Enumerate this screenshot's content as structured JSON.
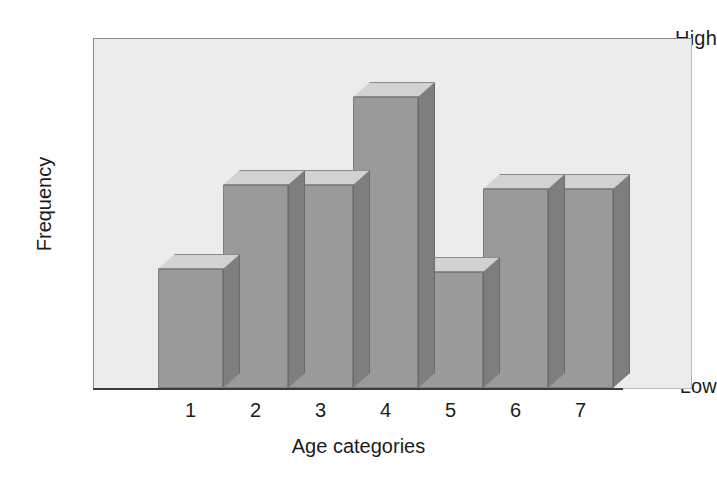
{
  "chart_data": {
    "type": "bar",
    "title": "",
    "subtitle": "",
    "xlabel": "Age categories",
    "ylabel": "Frequency",
    "categories": [
      "1",
      "2",
      "3",
      "4",
      "5",
      "6",
      "7"
    ],
    "values": [
      34,
      58,
      58,
      83,
      33,
      57,
      57
    ],
    "ylim": [
      0,
      100
    ],
    "ytick_labels": [
      "High",
      "Low"
    ],
    "ytick_values": [
      100,
      0
    ],
    "grid": false,
    "legend": null,
    "style": "3d-bar",
    "annotations": [],
    "colors": {
      "bar_face": "#9a9a9a",
      "bar_top": "#d2d2d2",
      "bar_side": "#7e7e7e",
      "bar_edge": "#7d7d7d",
      "plot_background": "#ececec",
      "figure_background": "#ffffff",
      "text": "#1c1c1c",
      "axis_line": "#3c3c3c"
    }
  },
  "axes": {
    "y": {
      "title": "Frequency",
      "tick_high": "High",
      "tick_low": "Low"
    },
    "x": {
      "title": "Age categories",
      "ticks": [
        "1",
        "2",
        "3",
        "4",
        "5",
        "6",
        "7"
      ]
    }
  }
}
